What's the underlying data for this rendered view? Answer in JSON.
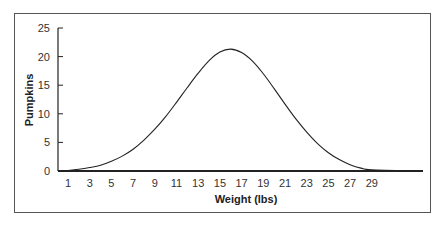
{
  "chart_data": {
    "type": "line",
    "title": "",
    "xlabel": "Weight (lbs)",
    "ylabel": "Pumpkins",
    "x_tick_labels": [
      "1",
      "3",
      "5",
      "7",
      "9",
      "11",
      "13",
      "15",
      "17",
      "19",
      "21",
      "23",
      "25",
      "27",
      "29"
    ],
    "y_tick_labels": [
      "0",
      "5",
      "10",
      "15",
      "20",
      "25"
    ],
    "xlim": [
      0,
      31
    ],
    "ylim": [
      0,
      25
    ],
    "grid": false,
    "legend": null,
    "series": [
      {
        "name": "Pumpkins",
        "x": [
          0,
          1,
          2,
          3,
          4,
          5,
          6,
          7,
          8,
          9,
          10,
          11,
          12,
          13,
          14,
          15,
          16,
          17,
          18,
          19,
          20,
          21,
          22,
          23,
          24,
          25,
          26,
          27,
          28,
          29,
          30
        ],
        "values": [
          0.0,
          0.1,
          0.3,
          0.6,
          1.0,
          1.7,
          2.6,
          3.8,
          5.4,
          7.3,
          9.5,
          12.0,
          14.6,
          17.1,
          19.3,
          20.8,
          21.3,
          20.7,
          19.2,
          17.0,
          14.4,
          11.7,
          9.1,
          6.8,
          4.8,
          3.2,
          2.0,
          1.1,
          0.5,
          0.2,
          0.0
        ]
      }
    ],
    "peak": {
      "x": 16,
      "y": 21.3
    }
  }
}
